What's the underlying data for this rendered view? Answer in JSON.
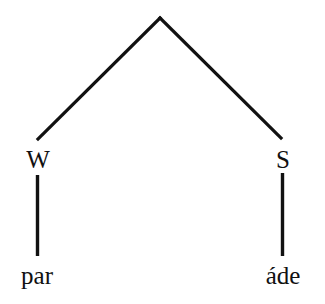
{
  "diagram": {
    "type": "metrical-tree",
    "root": {
      "label": "",
      "children": [
        {
          "label": "W",
          "terminal": "par"
        },
        {
          "label": "S",
          "terminal": "áde"
        }
      ]
    }
  },
  "nodes": {
    "weak": "W",
    "strong": "S"
  },
  "terminals": {
    "left": "par",
    "right": "áde"
  },
  "colors": {
    "line": "#111111",
    "text": "#111111",
    "background": "#ffffff"
  }
}
